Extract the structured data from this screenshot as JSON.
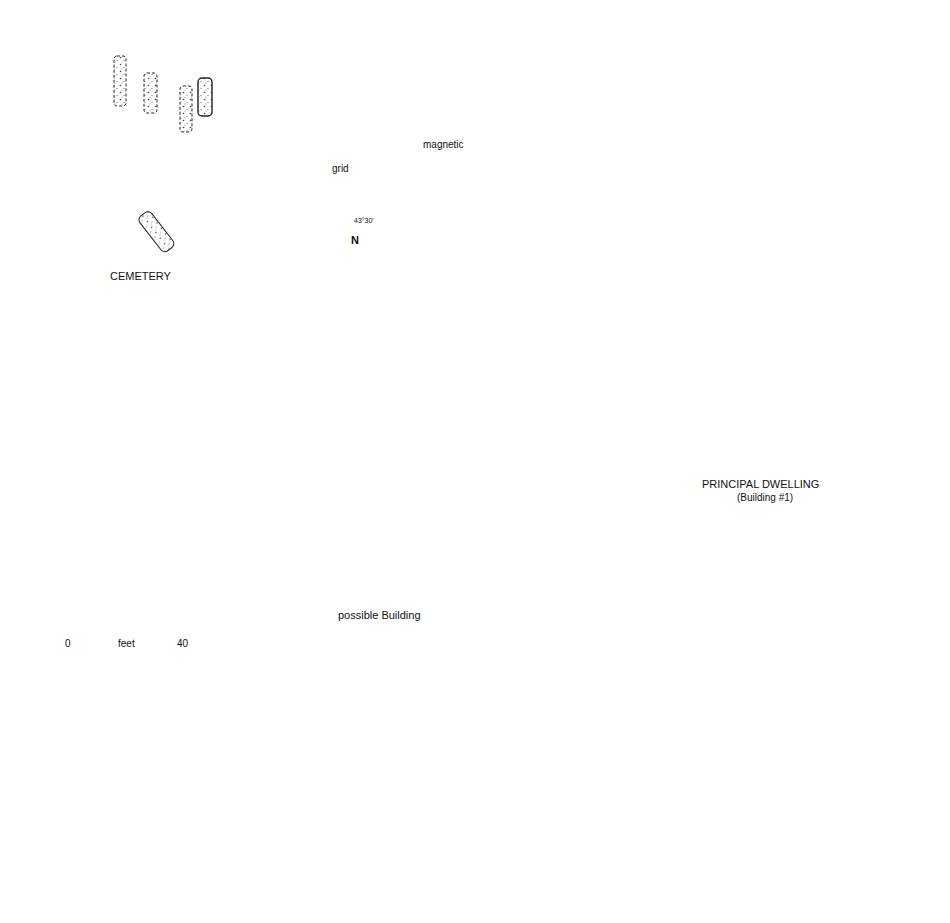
{
  "labels": {
    "cemetery": "CEMETERY",
    "principal_dwelling": "PRINCIPAL DWELLING",
    "principal_dwelling_sub": "(Building #1)",
    "possible_building": "possible Building"
  },
  "north_arrow": {
    "grid_label": "grid",
    "magnetic_label": "magnetic",
    "declination": "43°30'",
    "north_letter": "N"
  },
  "scale_bar": {
    "start": "0",
    "unit": "feet",
    "end": "40"
  },
  "colors": {
    "ink": "#111111",
    "background": "#ffffff",
    "stipple": "#bdbdbd"
  }
}
